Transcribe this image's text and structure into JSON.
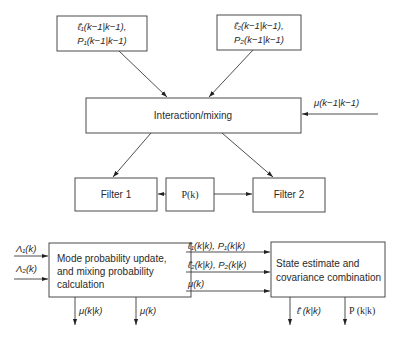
{
  "diagram": {
    "nodes": {
      "input1": {
        "line1": "ℓ̂₁(k−1|k−1),",
        "line2": "P₁(k−1|k−1)"
      },
      "input2": {
        "line1": "ℓ̂₂(k−1|k−1),",
        "line2": "P₂(k−1|k−1)"
      },
      "interaction": {
        "label": "Interaction/mixing"
      },
      "filter1": {
        "label": "Filter 1"
      },
      "pk": {
        "label": "P(k)"
      },
      "filter2": {
        "label": "Filter 2"
      },
      "mode_update": {
        "line1": "Mode probability update,",
        "line2": "and mixing probability",
        "line3": "calculation"
      },
      "state_combo": {
        "line1": "State estimate and",
        "line2": "covariance combination"
      }
    },
    "edge_labels": {
      "mu_prev": "μ(k−1|k−1)",
      "lambda1": "Λ₁(k)",
      "lambda2": "Λ₂(k)",
      "mu_kk": "μ(k|k)",
      "mu_k": "μ(k)",
      "state1": "ℓ̂₁(k|k), P₁(k|k)",
      "state2": "ℓ̂₂(k|k), P₂(k|k)",
      "mu_k_in": "μ(k)",
      "ell_out": "ℓ̂ (k|k)",
      "p_out": "P (k|k)"
    },
    "edges": [
      {
        "from": "input1",
        "to": "interaction"
      },
      {
        "from": "input2",
        "to": "interaction"
      },
      {
        "from": "mu_prev",
        "to": "interaction"
      },
      {
        "from": "interaction",
        "to": "filter1"
      },
      {
        "from": "interaction",
        "to": "filter2"
      },
      {
        "from": "pk",
        "to": "filter1"
      },
      {
        "from": "pk",
        "to": "filter2"
      },
      {
        "from": "lambda1",
        "to": "mode_update"
      },
      {
        "from": "lambda2",
        "to": "mode_update"
      },
      {
        "from": "mode_update",
        "to": "mu_kk"
      },
      {
        "from": "mode_update",
        "to": "mu_k"
      },
      {
        "from": "state1",
        "to": "state_combo"
      },
      {
        "from": "state2",
        "to": "state_combo"
      },
      {
        "from": "mu_k_in",
        "to": "state_combo"
      },
      {
        "from": "state_combo",
        "to": "ell_out"
      },
      {
        "from": "state_combo",
        "to": "p_out"
      }
    ]
  }
}
